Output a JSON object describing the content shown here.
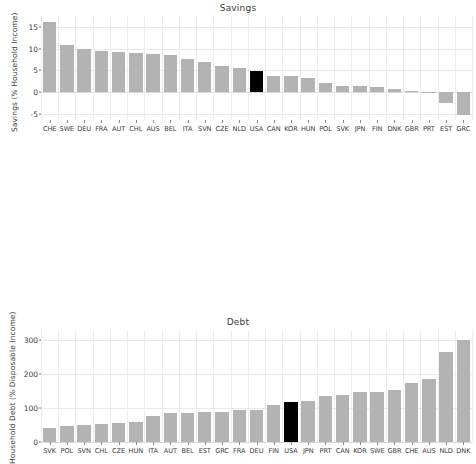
{
  "chart_data": [
    {
      "type": "bar",
      "title": "Savings",
      "xlabel": "",
      "ylabel": "Savings (% Household Income)",
      "ylim": [
        -6.5,
        17.5
      ],
      "yticks": [
        15,
        10,
        5,
        0,
        -5
      ],
      "ytick_labels": [
        "15",
        "10",
        "5",
        "0",
        "-5"
      ],
      "grid": true,
      "legend": "none",
      "highlight_category": "USA",
      "highlight_color": "#000000",
      "bar_color": "#b3b3b3",
      "categories": [
        "CHE",
        "SWE",
        "DEU",
        "FRA",
        "AUT",
        "CHL",
        "AUS",
        "BEL",
        "ITA",
        "SVN",
        "CZE",
        "NLD",
        "USA",
        "CAN",
        "KOR",
        "HUN",
        "POL",
        "SVK",
        "JPN",
        "FIN",
        "DNK",
        "GBR",
        "PRT",
        "EST",
        "GRC"
      ],
      "values": [
        16.2,
        10.8,
        9.8,
        9.5,
        9.1,
        9.0,
        8.8,
        8.6,
        7.5,
        6.8,
        5.9,
        5.5,
        4.8,
        3.6,
        3.6,
        3.3,
        2.1,
        1.4,
        1.3,
        1.1,
        0.6,
        0.3,
        -0.2,
        -2.5,
        -5.3
      ]
    },
    {
      "type": "bar",
      "title": "Debt",
      "xlabel": "",
      "ylabel": "Household Debt (% Disposable Income)",
      "ylim": [
        0,
        330
      ],
      "yticks": [
        300,
        200,
        100,
        0
      ],
      "ytick_labels": [
        "300",
        "200",
        "100",
        "0"
      ],
      "grid": true,
      "legend": "none",
      "highlight_category": "USA",
      "highlight_color": "#000000",
      "bar_color": "#b3b3b3",
      "categories": [
        "SVK",
        "POL",
        "SVN",
        "CHL",
        "CZE",
        "HUN",
        "ITA",
        "AUT",
        "BEL",
        "EST",
        "GRC",
        "FRA",
        "DEU",
        "FIN",
        "USA",
        "JPN",
        "PRT",
        "CAN",
        "KOR",
        "SWE",
        "GBR",
        "CHE",
        "AUS",
        "NLD",
        "DNK"
      ],
      "values": [
        40,
        48,
        50,
        54,
        56,
        60,
        77,
        85,
        85,
        88,
        89,
        93,
        95,
        108,
        117,
        121,
        135,
        139,
        148,
        148,
        154,
        175,
        185,
        265,
        300
      ]
    }
  ]
}
